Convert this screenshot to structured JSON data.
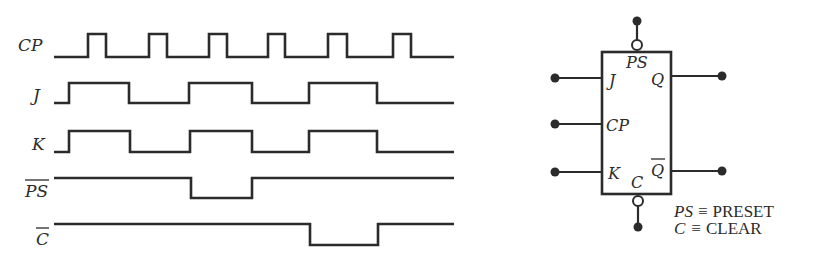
{
  "timing_diagram": {
    "signals": [
      {
        "id": "cp",
        "label": "CP",
        "overbar": false
      },
      {
        "id": "j",
        "label": "J",
        "overbar": false
      },
      {
        "id": "k",
        "label": "K",
        "overbar": false
      },
      {
        "id": "ps_bar",
        "label": "PS",
        "overbar": true
      },
      {
        "id": "c_bar",
        "label": "C",
        "overbar": true
      }
    ],
    "x_start": 54,
    "x_end": 454,
    "waveforms": {
      "cp": {
        "low_y": 57,
        "high_y": 34,
        "initial": "low",
        "edges": [
          88,
          106,
          149,
          167,
          209,
          227,
          268,
          285,
          328,
          347,
          393,
          411
        ]
      },
      "j": {
        "low_y": 103,
        "high_y": 83,
        "initial": "low",
        "edges": [
          69,
          129,
          189,
          252,
          309,
          377
        ]
      },
      "k": {
        "low_y": 152,
        "high_y": 131,
        "initial": "low",
        "edges": [
          69,
          130,
          190,
          252,
          309,
          377
        ]
      },
      "ps_bar": {
        "low_y": 198,
        "high_y": 178,
        "initial": "high",
        "edges": [
          191,
          252
        ]
      },
      "c_bar": {
        "low_y": 245,
        "high_y": 224,
        "initial": "high",
        "edges": [
          310,
          378
        ]
      }
    }
  },
  "flip_flop": {
    "pins": {
      "preset": "PS",
      "j": "J",
      "q": "Q",
      "clock": "CP",
      "k": "K",
      "q_bar": "Q",
      "clear": "C"
    }
  },
  "legend": [
    {
      "symbol": "PS",
      "equiv": "≡",
      "meaning": "PRESET"
    },
    {
      "symbol": "C",
      "equiv": "≡",
      "meaning": "CLEAR"
    }
  ]
}
